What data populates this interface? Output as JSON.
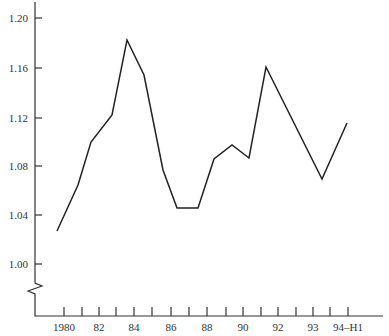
{
  "chart_data": {
    "type": "line",
    "title": "",
    "xlabel": "",
    "ylabel": "",
    "ylim": [
      1.0,
      1.2
    ],
    "y_axis_break": true,
    "grid": false,
    "legend": null,
    "x_tick_labels": [
      "1980",
      "82",
      "84",
      "86",
      "88",
      "90",
      "92",
      "93",
      "94–H1"
    ],
    "y_tick_labels": [
      "1.20",
      "1.16",
      "1.12",
      "1.08",
      "1.04",
      "1.00"
    ],
    "series": [
      {
        "name": "series",
        "color": "#222222",
        "points": [
          {
            "x": 1979.6,
            "y": 1.027
          },
          {
            "x": 1980.8,
            "y": 1.064
          },
          {
            "x": 1981.5,
            "y": 1.1
          },
          {
            "x": 1982.7,
            "y": 1.122
          },
          {
            "x": 1983.5,
            "y": 1.183
          },
          {
            "x": 1984.5,
            "y": 1.154
          },
          {
            "x": 1985.6,
            "y": 1.076
          },
          {
            "x": 1986.3,
            "y": 1.046
          },
          {
            "x": 1987.5,
            "y": 1.047
          },
          {
            "x": 1988.4,
            "y": 1.085
          },
          {
            "x": 1989.4,
            "y": 1.097
          },
          {
            "x": 1990.4,
            "y": 1.086
          },
          {
            "x": 1991.3,
            "y": 1.161
          },
          {
            "x": 1993.4,
            "y": 1.069
          },
          {
            "x": 1994.0,
            "y": 1.116
          }
        ]
      }
    ]
  },
  "layout": {
    "y_axis_x": 35,
    "x_axis_y": 316,
    "x_axis_end": 383,
    "y_axis_top": 2,
    "y_ticks_px": [
      18,
      68,
      118,
      166,
      215,
      264
    ],
    "x_ticks_px": [
      64,
      82,
      99,
      116,
      134,
      152,
      171,
      189,
      207,
      226,
      243,
      261,
      278,
      296,
      313,
      330,
      348
    ],
    "x_label_ticks_px": [
      64,
      99,
      134,
      171,
      207,
      243,
      278,
      313,
      348
    ],
    "points_px": [
      [
        57,
        231
      ],
      [
        78,
        185
      ],
      [
        91,
        142
      ],
      [
        112,
        115
      ],
      [
        127,
        40
      ],
      [
        144,
        75
      ],
      [
        163,
        170
      ],
      [
        177,
        208
      ],
      [
        198,
        208
      ],
      [
        214,
        159
      ],
      [
        232,
        145
      ],
      [
        249,
        158
      ],
      [
        266,
        67
      ],
      [
        322,
        179
      ],
      [
        347,
        123
      ]
    ]
  }
}
